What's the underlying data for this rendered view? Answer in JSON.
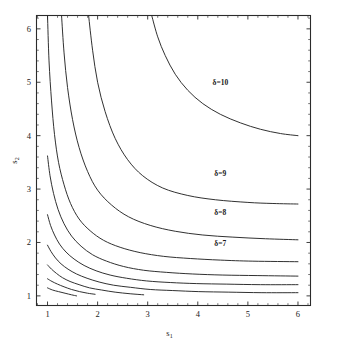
{
  "figure": {
    "background": "#ffffff",
    "line_color": "#262626",
    "axis_color": "#2b2b2b"
  },
  "chart_data": {
    "type": "line",
    "title": "",
    "subtitle": "",
    "xlabel": "s",
    "xlabel_sub": "1",
    "ylabel": "s",
    "ylabel_sub": "2",
    "xlim": [
      0.78,
      6.25
    ],
    "ylim": [
      0.82,
      6.25
    ],
    "xticks": [
      1,
      2,
      3,
      4,
      5,
      6
    ],
    "xticklabels": [
      "1",
      "2",
      "3",
      "4",
      "5",
      "6"
    ],
    "yticks": [
      1,
      2,
      3,
      4,
      5,
      6
    ],
    "yticklabels": [
      "1",
      "2",
      "3",
      "4",
      "5",
      "6"
    ],
    "grid": false,
    "legend": "none",
    "annotations": [
      {
        "text": "δ=10",
        "x": 4.45,
        "y": 4.95
      },
      {
        "text": "δ=9",
        "x": 4.45,
        "y": 3.25
      },
      {
        "text": "δ=8",
        "x": 4.45,
        "y": 2.52
      },
      {
        "text": "δ=7",
        "x": 4.45,
        "y": 1.93
      }
    ],
    "series": [
      {
        "name": "δ=10",
        "label": "δ=10",
        "points": [
          [
            3.08,
            6.25
          ],
          [
            3.2,
            5.85
          ],
          [
            3.35,
            5.5
          ],
          [
            3.55,
            5.15
          ],
          [
            3.8,
            4.85
          ],
          [
            4.1,
            4.6
          ],
          [
            4.45,
            4.4
          ],
          [
            4.85,
            4.24
          ],
          [
            5.25,
            4.12
          ],
          [
            5.65,
            4.04
          ],
          [
            6.0,
            4.0
          ]
        ]
      },
      {
        "name": "δ=9",
        "label": "δ=9",
        "points": [
          [
            1.82,
            6.25
          ],
          [
            1.9,
            5.6
          ],
          [
            2.0,
            5.0
          ],
          [
            2.15,
            4.45
          ],
          [
            2.35,
            3.95
          ],
          [
            2.6,
            3.55
          ],
          [
            2.9,
            3.25
          ],
          [
            3.3,
            3.02
          ],
          [
            3.8,
            2.88
          ],
          [
            4.35,
            2.8
          ],
          [
            5.0,
            2.75
          ],
          [
            5.5,
            2.73
          ],
          [
            6.0,
            2.72
          ]
        ]
      },
      {
        "name": "δ=8",
        "label": "δ=8",
        "points": [
          [
            1.28,
            6.25
          ],
          [
            1.33,
            5.55
          ],
          [
            1.4,
            4.9
          ],
          [
            1.5,
            4.3
          ],
          [
            1.63,
            3.78
          ],
          [
            1.8,
            3.33
          ],
          [
            2.0,
            2.98
          ],
          [
            2.28,
            2.7
          ],
          [
            2.62,
            2.48
          ],
          [
            3.05,
            2.32
          ],
          [
            3.55,
            2.21
          ],
          [
            4.1,
            2.14
          ],
          [
            4.7,
            2.1
          ],
          [
            5.35,
            2.07
          ],
          [
            6.0,
            2.05
          ]
        ]
      },
      {
        "name": "δ=7",
        "label": "δ=7",
        "points": [
          [
            1.0,
            6.25
          ],
          [
            1.03,
            5.4
          ],
          [
            1.08,
            4.65
          ],
          [
            1.14,
            4.02
          ],
          [
            1.22,
            3.5
          ],
          [
            1.33,
            3.08
          ],
          [
            1.46,
            2.73
          ],
          [
            1.63,
            2.44
          ],
          [
            1.85,
            2.22
          ],
          [
            2.12,
            2.04
          ],
          [
            2.45,
            1.91
          ],
          [
            2.85,
            1.81
          ],
          [
            3.32,
            1.74
          ],
          [
            3.85,
            1.7
          ],
          [
            4.45,
            1.67
          ],
          [
            5.1,
            1.65
          ],
          [
            6.0,
            1.64
          ]
        ]
      },
      {
        "name": "δ=6",
        "label": "",
        "points": [
          [
            1.0,
            3.62
          ],
          [
            1.05,
            3.25
          ],
          [
            1.12,
            2.92
          ],
          [
            1.21,
            2.62
          ],
          [
            1.33,
            2.35
          ],
          [
            1.48,
            2.12
          ],
          [
            1.67,
            1.93
          ],
          [
            1.9,
            1.77
          ],
          [
            2.18,
            1.65
          ],
          [
            2.52,
            1.55
          ],
          [
            2.92,
            1.48
          ],
          [
            3.38,
            1.44
          ],
          [
            3.9,
            1.41
          ],
          [
            4.5,
            1.39
          ],
          [
            5.2,
            1.38
          ],
          [
            6.0,
            1.37
          ]
        ]
      },
      {
        "name": "δ=5",
        "label": "",
        "points": [
          [
            1.0,
            2.52
          ],
          [
            1.06,
            2.32
          ],
          [
            1.14,
            2.14
          ],
          [
            1.24,
            1.97
          ],
          [
            1.37,
            1.82
          ],
          [
            1.53,
            1.69
          ],
          [
            1.73,
            1.57
          ],
          [
            1.97,
            1.47
          ],
          [
            2.25,
            1.39
          ],
          [
            2.58,
            1.33
          ],
          [
            2.98,
            1.28
          ],
          [
            3.45,
            1.25
          ],
          [
            3.98,
            1.23
          ],
          [
            4.58,
            1.22
          ],
          [
            5.25,
            1.21
          ],
          [
            6.0,
            1.21
          ]
        ]
      },
      {
        "name": "δ=4b",
        "label": "",
        "points": [
          [
            1.0,
            1.95
          ],
          [
            1.07,
            1.83
          ],
          [
            1.16,
            1.71
          ],
          [
            1.27,
            1.6
          ],
          [
            1.41,
            1.5
          ],
          [
            1.58,
            1.41
          ],
          [
            1.79,
            1.33
          ],
          [
            2.03,
            1.26
          ],
          [
            2.32,
            1.2
          ],
          [
            2.66,
            1.16
          ],
          [
            3.05,
            1.12
          ],
          [
            3.5,
            1.1
          ],
          [
            4.02,
            1.08
          ],
          [
            4.62,
            1.07
          ],
          [
            5.28,
            1.06
          ],
          [
            6.0,
            1.06
          ]
        ]
      },
      {
        "name": "δ=4",
        "label": "",
        "points": [
          [
            1.0,
            1.58
          ],
          [
            1.08,
            1.5
          ],
          [
            1.18,
            1.42
          ],
          [
            1.3,
            1.34
          ],
          [
            1.45,
            1.27
          ],
          [
            1.63,
            1.21
          ],
          [
            1.84,
            1.15
          ],
          [
            2.08,
            1.11
          ],
          [
            2.35,
            1.07
          ],
          [
            2.65,
            1.04
          ],
          [
            2.92,
            1.02
          ]
        ]
      },
      {
        "name": "δ=3",
        "label": "",
        "points": [
          [
            1.0,
            1.32
          ],
          [
            1.09,
            1.27
          ],
          [
            1.2,
            1.22
          ],
          [
            1.33,
            1.17
          ],
          [
            1.48,
            1.12
          ],
          [
            1.64,
            1.08
          ],
          [
            1.8,
            1.05
          ],
          [
            1.95,
            1.03
          ]
        ]
      },
      {
        "name": "δ=2",
        "label": "",
        "points": [
          [
            1.0,
            1.15
          ],
          [
            1.1,
            1.11
          ],
          [
            1.22,
            1.08
          ],
          [
            1.35,
            1.05
          ],
          [
            1.48,
            1.02
          ],
          [
            1.58,
            1.0
          ]
        ]
      }
    ]
  },
  "caption": {
    "text": ""
  }
}
